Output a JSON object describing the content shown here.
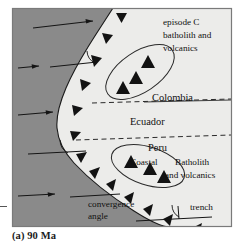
{
  "figure": {
    "caption": "(a) 90 Ma",
    "frame": {
      "x": 12,
      "y": 8,
      "width": 220,
      "height": 219
    },
    "colors": {
      "ocean": "#8a8a8a",
      "continent": "#ececea",
      "line": "#1a1a1a",
      "frame_border": "#6f6f6f",
      "text": "#111111"
    }
  },
  "labels": {
    "episode_c": {
      "line1": "episode C",
      "line2": "batholith and",
      "line3": "volcanics"
    },
    "colombia": "Colombia",
    "ecuador": "Ecuador",
    "peru": "Peru",
    "coastal_batholith": {
      "line1_a": "Coastal",
      "line1_b": "Batholith",
      "line2": "and volcanics"
    },
    "convergence_angle": {
      "line1": "convergence",
      "line2": "angle"
    },
    "trench": "trench"
  },
  "features": {
    "plate_motion_arrows": [
      {
        "id": "arrow-top",
        "x1": 33,
        "y1": 28,
        "x2": 93,
        "y2": 21
      },
      {
        "id": "arrow-upper-mid",
        "x1": 18,
        "y1": 68,
        "x2": 39,
        "y2": 66
      },
      {
        "id": "arrow-mid",
        "x1": 18,
        "y1": 115,
        "x2": 53,
        "y2": 112
      },
      {
        "id": "arrow-lower",
        "x1": 18,
        "y1": 196,
        "x2": 55,
        "y2": 194
      }
    ],
    "convergence_reference_lines": [
      {
        "id": "ref-line-upper",
        "x1": 57,
        "y1": 66,
        "x2": 97,
        "y2": 62
      },
      {
        "id": "ref-line-mid",
        "x1": 33,
        "y1": 154,
        "x2": 84,
        "y2": 152
      },
      {
        "id": "ref-line-lower",
        "x1": 72,
        "y1": 196,
        "x2": 117,
        "y2": 194
      },
      {
        "id": "ref-line-trench",
        "x1": 140,
        "y1": 220,
        "x2": 210,
        "y2": 217
      }
    ],
    "subduction_trench_teeth_count": 14,
    "batholith_ellipses": [
      {
        "id": "ellipse-colombia",
        "cx": 140,
        "cy": 72,
        "rx": 39,
        "ry": 20,
        "rotation": -34,
        "triangles": 3
      },
      {
        "id": "ellipse-peru",
        "cx": 148,
        "cy": 166,
        "rx": 38,
        "ry": 19,
        "rotation": 18,
        "triangles": 3
      }
    ],
    "country_border_dashed_lines": [
      {
        "id": "border-colombia-ecuador",
        "y": 101
      },
      {
        "id": "border-ecuador-peru",
        "y": 137
      }
    ],
    "angle_arcs": [
      {
        "id": "arc-upper",
        "cx": 92,
        "cy": 63
      },
      {
        "id": "arc-mid",
        "cx": 66,
        "cy": 152
      },
      {
        "id": "arc-trench",
        "cx": 178,
        "cy": 218
      }
    ]
  }
}
